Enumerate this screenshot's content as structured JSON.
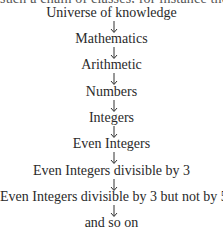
{
  "header_fragment": "such a chain of classes, for instance the following",
  "chain": [
    {
      "label": "Universe of knowledge"
    },
    {
      "label": "Mathematics"
    },
    {
      "label": "Arithmetic"
    },
    {
      "label": "Numbers"
    },
    {
      "label": "Integers"
    },
    {
      "label": "Even Integers"
    },
    {
      "label": "Even Integers divisible by 3"
    },
    {
      "label": "Even Integers divisible by 3 but not by 5"
    },
    {
      "label": "and so on"
    }
  ],
  "arrow_icon": "down-arrow"
}
